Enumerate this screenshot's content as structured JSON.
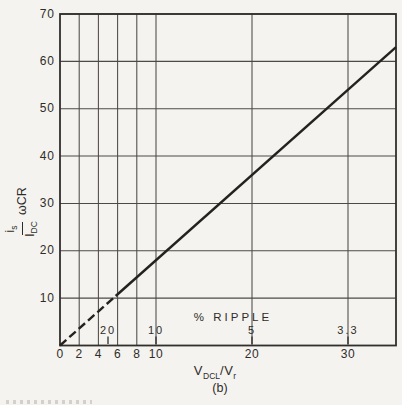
{
  "chart_data": {
    "type": "line",
    "title": "",
    "xlabel": "V_DCL / V_r",
    "ylabel": "(i_s / I_DC) ωCR",
    "x_range": [
      0,
      35
    ],
    "y_range": [
      0,
      70
    ],
    "x_ticks": [
      0,
      2,
      4,
      6,
      8,
      10,
      20,
      30
    ],
    "y_ticks": [
      10,
      20,
      30,
      40,
      50,
      60,
      70
    ],
    "grid_x": [
      2,
      4,
      6,
      8,
      10,
      20,
      30
    ],
    "grid_y": [
      10,
      20,
      30,
      40,
      50,
      60,
      70
    ],
    "grid": "on",
    "legend": "none",
    "series": [
      {
        "name": "dashed extrapolation to origin",
        "style": "dashed",
        "points": [
          [
            0,
            0
          ],
          [
            5.8,
            10.45
          ]
        ]
      },
      {
        "name": "(i_s/I_DC)·ωCR vs V_DCL/V_r",
        "style": "solid",
        "points": [
          [
            5.8,
            10.45
          ],
          [
            35,
            63
          ]
        ]
      }
    ],
    "ripple_scale": {
      "label": "% RIPPLE",
      "entries": [
        {
          "label": "20",
          "x": 5
        },
        {
          "label": "10",
          "x": 10
        },
        {
          "label": "5",
          "x": 20
        },
        {
          "label": "3.3",
          "x": 30
        }
      ]
    }
  },
  "labels": {
    "ylabel": {
      "numerator_base": "i",
      "numerator_sub": "s",
      "denominator_base": "I",
      "denominator_sub": "DC",
      "factor": "ωCR"
    },
    "xlabel": {
      "base1": "V",
      "sub1": "DCL",
      "slash": "/",
      "base2": "V",
      "sub2": "r"
    },
    "caption": "(b)"
  }
}
